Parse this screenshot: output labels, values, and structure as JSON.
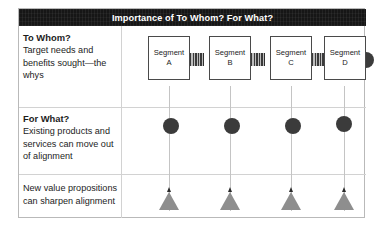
{
  "figure": {
    "title": "Importance of To Whom? For What?",
    "accent_dark": "#161616",
    "grid_line_color": "#d2d2d2",
    "shape_dark": "#3b3b3b",
    "shape_gray": "#8e8e8e"
  },
  "rows": [
    {
      "heading": "To Whom?",
      "body": "Target needs and benefits sought—the whys"
    },
    {
      "heading": "For What?",
      "body": "Existing products and services can move out of alignment"
    },
    {
      "heading": "",
      "body": "New value propositions can sharpen alignment"
    }
  ],
  "segments": [
    {
      "label": "Segment",
      "sublabel": "A"
    },
    {
      "label": "Segment",
      "sublabel": "B"
    },
    {
      "label": "Segment",
      "sublabel": "C"
    },
    {
      "label": "Segment",
      "sublabel": "D"
    }
  ],
  "connectors": [
    {
      "name": "coil-connector-ab"
    },
    {
      "name": "coil-connector-bc"
    },
    {
      "name": "coil-connector-cd"
    },
    {
      "name": "end-cap-disc"
    }
  ],
  "weights": [
    {
      "name": "weight-a"
    },
    {
      "name": "weight-b"
    },
    {
      "name": "weight-c"
    },
    {
      "name": "weight-d"
    }
  ],
  "pendulums": [
    {
      "name": "pendulum-a"
    },
    {
      "name": "pendulum-b"
    },
    {
      "name": "pendulum-c"
    },
    {
      "name": "pendulum-d"
    }
  ]
}
